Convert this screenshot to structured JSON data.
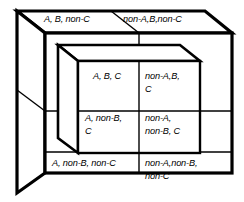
{
  "figure": {
    "type": "logic-partition-cube",
    "stroke_color": "#000000",
    "background_color": "#ffffff",
    "outer_cube_stroke_width": 3.2,
    "inner_cube_stroke_width": 1.5,
    "label_style": "italic"
  },
  "labels": {
    "top_left": "A, B, non-C",
    "top_right": "non-A,B,non-C",
    "inner_top_left": "A, B, C",
    "inner_top_right": "non-A,B,\nC",
    "inner_bottom_left": "A, non-B,\n      C",
    "inner_bottom_right": "non-A,\nnon-B, C",
    "outer_bottom_left": "A, non-B, non-C",
    "outer_bottom_right": "non-A,non-B,\nnon-C"
  },
  "terms": {
    "a_positive": "A",
    "a_negative": "non-A",
    "b_positive": "B",
    "b_negative": "non-B",
    "c_positive": "C",
    "c_negative": "non-C"
  },
  "regions": [
    {
      "name": "region-a-b-nonc",
      "text": "A, B, non-C",
      "face": "top-face-left"
    },
    {
      "name": "region-nona-b-nonc",
      "text": "non-A,B,non-C",
      "face": "top-face-right"
    },
    {
      "name": "region-a-b-c",
      "text": "A, B, C",
      "face": "inner-front-top-left"
    },
    {
      "name": "region-nona-b-c",
      "text": "non-A,B, C",
      "face": "inner-front-top-right"
    },
    {
      "name": "region-a-nonb-c",
      "text": "A, non-B, C",
      "face": "inner-front-bottom-left"
    },
    {
      "name": "region-nona-nonb-c",
      "text": "non-A, non-B, C",
      "face": "inner-front-bottom-right"
    },
    {
      "name": "region-a-nonb-nonc",
      "text": "A, non-B, non-C",
      "face": "outer-front-bottom-left"
    },
    {
      "name": "region-nona-nonb-nonc",
      "text": "non-A,non-B, non-C",
      "face": "outer-front-bottom-right"
    }
  ]
}
